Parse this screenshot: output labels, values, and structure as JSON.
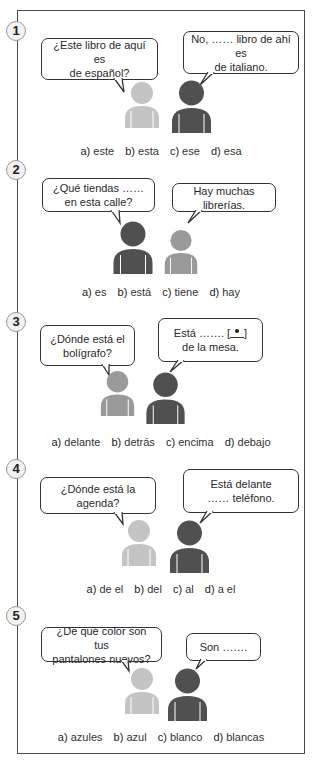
{
  "exercises": [
    {
      "number": "1",
      "question": [
        "¿Este libro de aquí es",
        "de español?"
      ],
      "reply": [
        "No, …… libro de ahí es",
        "de italiano."
      ],
      "options": [
        {
          "letter": "a)",
          "text": "este"
        },
        {
          "letter": "b)",
          "text": "esta"
        },
        {
          "letter": "c)",
          "text": "ese"
        },
        {
          "letter": "d)",
          "text": "esa"
        }
      ],
      "figures": [
        "light-gray",
        "dark-gray"
      ]
    },
    {
      "number": "2",
      "question": [
        "¿Qué tiendas ……",
        "en esta calle?"
      ],
      "reply": [
        "Hay muchas librerías."
      ],
      "options": [
        {
          "letter": "a)",
          "text": "es"
        },
        {
          "letter": "b)",
          "text": "está"
        },
        {
          "letter": "c)",
          "text": "tiene"
        },
        {
          "letter": "d)",
          "text": "hay"
        }
      ],
      "figures": [
        "dark-gray",
        "medium-gray"
      ]
    },
    {
      "number": "3",
      "question": [
        "¿Dónde está el",
        "bolígrafo?"
      ],
      "reply": [
        "Está ……. [",
        "de la mesa."
      ],
      "reply_icon": "pen-below-table-icon",
      "options": [
        {
          "letter": "a)",
          "text": "delante"
        },
        {
          "letter": "b)",
          "text": "detrás"
        },
        {
          "letter": "c)",
          "text": "encima"
        },
        {
          "letter": "d)",
          "text": "debajo"
        }
      ],
      "figures": [
        "medium-gray",
        "dark-gray"
      ]
    },
    {
      "number": "4",
      "question": [
        "¿Dónde está la agenda?"
      ],
      "reply": [
        "Está delante",
        "…… teléfono."
      ],
      "options": [
        {
          "letter": "a)",
          "text": "de el"
        },
        {
          "letter": "b)",
          "text": "del"
        },
        {
          "letter": "c)",
          "text": "al"
        },
        {
          "letter": "d)",
          "text": "a el"
        }
      ],
      "figures": [
        "light-gray",
        "dark-gray"
      ]
    },
    {
      "number": "5",
      "question": [
        "¿De qué color son tus",
        "pantalones nuevos?"
      ],
      "reply": [
        "Son ……."
      ],
      "options": [
        {
          "letter": "a)",
          "text": "azules"
        },
        {
          "letter": "b)",
          "text": "azul"
        },
        {
          "letter": "c)",
          "text": "blanco"
        },
        {
          "letter": "d)",
          "text": "blancas"
        }
      ],
      "figures": [
        "light-gray",
        "dark-gray"
      ]
    }
  ],
  "colors": {
    "light-gray": "#c4c4c4",
    "medium-gray": "#9a9a9a",
    "dark-gray": "#505050",
    "border": "#4a4a4a"
  }
}
